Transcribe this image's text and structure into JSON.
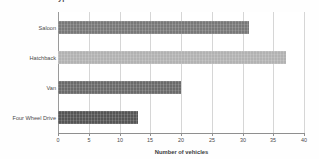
{
  "chart_data": {
    "type": "bar",
    "orientation": "horizontal",
    "title": "ypes of vehicles",
    "categories": [
      "Saloon",
      "Hatchback",
      "Van",
      "Four Wheel Drive"
    ],
    "values": [
      31,
      37,
      20,
      13
    ],
    "xlabel": "Number of vehicles",
    "ylabel": "",
    "xlim": [
      0,
      40
    ],
    "xticks": [
      0,
      5,
      10,
      15,
      20,
      25,
      30,
      35,
      40
    ],
    "xtick_labels": [
      "0",
      "5",
      "10",
      "15",
      "20",
      "25",
      "30",
      "35",
      "40"
    ],
    "grid": true,
    "grid_axis": "x",
    "legend": false,
    "bar_colors": [
      "#787878",
      "#b2b2b2",
      "#6a6a6a",
      "#555555"
    ],
    "background_color": "#ffffff",
    "gridline_color": "#d6d6d6",
    "axis_color": "#8f8f8f",
    "text_color": "#4a4a4a"
  }
}
